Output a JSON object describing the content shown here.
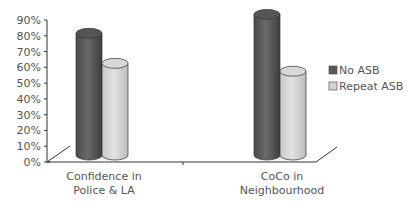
{
  "chart_data": {
    "type": "bar",
    "style": "3d-cylinder",
    "title": "",
    "xlabel": "",
    "ylabel": "",
    "categories": [
      "Confidence in Police & LA",
      "CoCo in Neighbourhood"
    ],
    "category_lines": [
      [
        "Confidence in",
        "Police & LA"
      ],
      [
        "CoCo in",
        "Neighbourhood"
      ]
    ],
    "series": [
      {
        "name": "No ASB",
        "values": [
          79,
          91
        ],
        "color": "#5a5a5a"
      },
      {
        "name": "Repeat ASB",
        "values": [
          60,
          55
        ],
        "color": "#d4d4d4"
      }
    ],
    "ylim": [
      0,
      90
    ],
    "yticks": [
      "0%",
      "10%",
      "20%",
      "30%",
      "40%",
      "50%",
      "60%",
      "70%",
      "80%",
      "90%"
    ],
    "grid": false,
    "legend_position": "right"
  },
  "legend": {
    "items": [
      {
        "label": "No ASB"
      },
      {
        "label": "Repeat ASB"
      }
    ]
  }
}
